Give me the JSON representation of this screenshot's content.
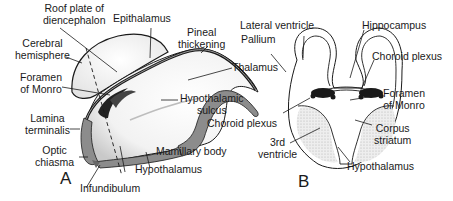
{
  "figure": {
    "panels": [
      {
        "id": "A",
        "label": "A",
        "view": "sagittal diencephalon"
      },
      {
        "id": "B",
        "label": "B",
        "view": "coronal section"
      }
    ],
    "panel_a_labels": {
      "roof_plate": [
        "Roof plate of",
        "diencephalon"
      ],
      "epithalamus": "Epithalamus",
      "pineal": [
        "Pineal",
        "thickening"
      ],
      "cerebral_hemisphere": [
        "Cerebral",
        "hemisphere"
      ],
      "foramen_monro": [
        "Foramen",
        "of Monro"
      ],
      "thalamus": "Thalamus",
      "hypothalamic_sulcus": [
        "Hypothalamic",
        "sulcus"
      ],
      "lamina_terminalis": [
        "Lamina",
        "terminalis"
      ],
      "optic_chiasma": [
        "Optic",
        "chiasma"
      ],
      "mamillary_body": "Mamillary body",
      "hypothalamus": "Hypothalamus",
      "infundibulum": "Infundibulum"
    },
    "panel_b_labels": {
      "lateral_ventricle": "Lateral ventricle",
      "pallium": "Pallium",
      "hippocampus": "Hippocampus",
      "choroid_plexus_right": "Choroid plexus",
      "foramen_monro": [
        "Foramen",
        "of Monro"
      ],
      "choroid_plexus_left": "Choroid plexus",
      "corpus_striatum": [
        "Corpus",
        "striatum"
      ],
      "third_ventricle": [
        "3rd",
        "ventricle"
      ],
      "hypothalamus": "Hypothalamus"
    },
    "colors": {
      "ink": "#1a1a1a",
      "gray_fill": "#8c8c8c",
      "stipple": "#d6d6d6",
      "background": "#ffffff"
    }
  }
}
